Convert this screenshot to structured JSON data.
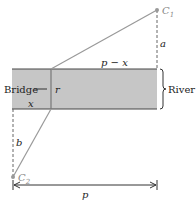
{
  "diagram": {
    "points": {
      "C1": {
        "label": "C",
        "sub": "1"
      },
      "C2": {
        "label": "C",
        "sub": "2"
      }
    },
    "labels": {
      "a": "a",
      "b": "b",
      "p_minus_x": "p − x",
      "x": "x",
      "r": "r",
      "p": "p",
      "bridge": "Bridge",
      "river": "River"
    },
    "colors": {
      "river_fill": "#c6c6c6",
      "line": "#8a8a8a",
      "edge": "#444444"
    }
  }
}
